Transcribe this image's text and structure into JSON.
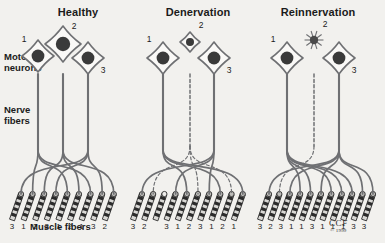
{
  "figure": {
    "background_color": "#f2f1ee",
    "ink_color": "#6f7073",
    "dark_color": "#2b2b2b",
    "text_color": "#1b1b1b"
  },
  "labels": {
    "motor_neurons_line1": "Motor",
    "motor_neurons_line2": "neurons",
    "nerve_fibers_line1": "Nerve",
    "nerve_fibers_line2": "fibers",
    "muscle_fibers": "Muscle fibers"
  },
  "credit": {
    "organization": "CCF",
    "copyright": "© 1999"
  },
  "panels": [
    {
      "id": "healthy",
      "title": "Healthy",
      "title_x": 78,
      "title_y": 14,
      "origin_x": 0,
      "neurons": [
        {
          "label": "1",
          "x": 38,
          "y": 56,
          "size": 16,
          "state": "normal",
          "label_x": 24,
          "label_y": 42
        },
        {
          "label": "2",
          "x": 63,
          "y": 44,
          "size": 18,
          "state": "normal",
          "label_x": 74,
          "label_y": 29
        },
        {
          "label": "3",
          "x": 88,
          "y": 58,
          "size": 16,
          "state": "normal",
          "label_x": 103,
          "label_y": 73
        }
      ],
      "axons": [
        {
          "neuron": "1",
          "x": 38,
          "style": "solid"
        },
        {
          "neuron": "2",
          "x": 63,
          "style": "solid"
        },
        {
          "neuron": "3",
          "x": 88,
          "style": "solid"
        }
      ],
      "muscle_fiber_labels": [
        "3",
        "1",
        "2",
        "3",
        "1",
        "2",
        "1",
        "3",
        "2"
      ],
      "muscle_fiber_states": [
        "innervated",
        "innervated",
        "innervated",
        "innervated",
        "innervated",
        "innervated",
        "innervated",
        "innervated",
        "innervated"
      ]
    },
    {
      "id": "denervation",
      "title": "Denervation",
      "title_x": 198,
      "title_y": 14,
      "origin_x": 125,
      "neurons": [
        {
          "label": "1",
          "x": 163,
          "y": 58,
          "size": 16,
          "state": "normal",
          "label_x": 149,
          "label_y": 42
        },
        {
          "label": "2",
          "x": 190,
          "y": 42,
          "size": 10,
          "state": "shrunken",
          "label_x": 201,
          "label_y": 28
        },
        {
          "label": "3",
          "x": 214,
          "y": 58,
          "size": 16,
          "state": "normal",
          "label_x": 229,
          "label_y": 73
        }
      ],
      "axons": [
        {
          "neuron": "1",
          "x": 163,
          "style": "solid"
        },
        {
          "neuron": "2",
          "x": 190,
          "style": "dashed"
        },
        {
          "neuron": "3",
          "x": 214,
          "style": "solid"
        }
      ],
      "muscle_fiber_labels": [
        "3",
        "2",
        "",
        "3",
        "1",
        "2",
        "3",
        "1",
        "2",
        "1"
      ],
      "muscle_fiber_states": [
        "innervated",
        "innervated",
        "denervated",
        "innervated",
        "innervated",
        "innervated",
        "innervated",
        "innervated",
        "innervated",
        "innervated"
      ]
    },
    {
      "id": "reinnervation",
      "title": "Reinnervation",
      "title_x": 318,
      "title_y": 14,
      "origin_x": 252,
      "neurons": [
        {
          "label": "1",
          "x": 287,
          "y": 58,
          "size": 16,
          "state": "normal",
          "label_x": 273,
          "label_y": 42
        },
        {
          "label": "2",
          "x": 314,
          "y": 40,
          "size": 7,
          "state": "degenerating",
          "label_x": 325,
          "label_y": 27
        },
        {
          "label": "3",
          "x": 339,
          "y": 58,
          "size": 16,
          "state": "normal",
          "label_x": 354,
          "label_y": 73
        }
      ],
      "axons": [
        {
          "neuron": "1",
          "x": 287,
          "style": "solid"
        },
        {
          "neuron": "2",
          "x": 314,
          "style": "dashed"
        },
        {
          "neuron": "3",
          "x": 339,
          "style": "solid"
        }
      ],
      "muscle_fiber_labels": [
        "3",
        "2",
        "3",
        "1",
        "1",
        "3",
        "1",
        "1",
        "1",
        "3",
        "3"
      ],
      "muscle_fiber_states": [
        "innervated",
        "innervated",
        "innervated",
        "innervated",
        "innervated",
        "innervated",
        "innervated",
        "innervated",
        "innervated",
        "innervated",
        "innervated"
      ]
    }
  ]
}
